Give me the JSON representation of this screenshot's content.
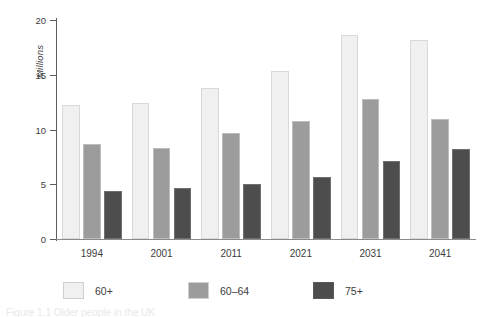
{
  "figure": {
    "background": "#ffffff",
    "caption_partial": "Figure 1.1  Older people in the UK"
  },
  "chart_data": {
    "type": "bar",
    "title": "",
    "subtitle": "",
    "xlabel": "",
    "ylabel": "Millions",
    "categories": [
      "1994",
      "2001",
      "2011",
      "2021",
      "2031",
      "2041"
    ],
    "series": [
      {
        "name": "60+",
        "color": "#f0f0f0",
        "values": [
          12.2,
          12.4,
          13.8,
          15.3,
          18.6,
          18.2
        ]
      },
      {
        "name": "60–64",
        "color": "#9c9c9c",
        "values": [
          8.7,
          8.3,
          9.7,
          10.8,
          12.8,
          11.0
        ]
      },
      {
        "name": "75+",
        "color": "#4d4d4d",
        "values": [
          4.4,
          4.7,
          5.0,
          5.7,
          7.1,
          8.2
        ]
      }
    ],
    "ylim": [
      0,
      20
    ],
    "yticks": [
      "0",
      "5",
      "10",
      "15",
      "20"
    ],
    "ytick_values": [
      0,
      5,
      10,
      15,
      20
    ],
    "grid": false,
    "legend_position": "below",
    "legend": [
      "60+",
      "60–64",
      "75+"
    ]
  },
  "axis": {
    "y_title": "Millions"
  }
}
